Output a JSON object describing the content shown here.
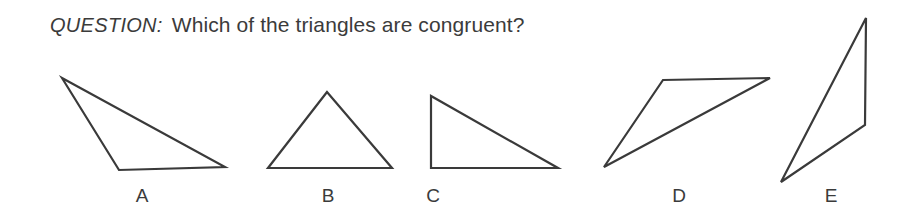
{
  "page": {
    "background_color": "#ffffff",
    "ink_color": "#3a3a3a",
    "width": 907,
    "height": 214
  },
  "question": {
    "tag": "QUESTION:",
    "text": "Which of the triangles are congruent?"
  },
  "figures": [
    {
      "id": "triangle-a",
      "label": "A",
      "description": "obtuse scalene triangle, long thin, apex upper-left",
      "points": "62,78 119,170 225,167"
    },
    {
      "id": "triangle-b",
      "label": "B",
      "description": "isosceles triangle pointing up",
      "points": "327,92 268,168 392,168"
    },
    {
      "id": "triangle-c",
      "label": "C",
      "description": "right triangle, right angle at lower-left",
      "points": "431,96 431,168 558,168"
    },
    {
      "id": "triangle-d",
      "label": "D",
      "description": "thin triangle, horizontal top edge, apex at lower-left",
      "points": "663,80 770,78 604,167"
    },
    {
      "id": "triangle-e",
      "label": "E",
      "description": "tall narrow triangle, vertical right edge, apex at bottom-left",
      "points": "866,18 865,125 781,182"
    }
  ],
  "labels": {
    "a": "A",
    "b": "B",
    "c": "C",
    "d": "D",
    "e": "E"
  }
}
